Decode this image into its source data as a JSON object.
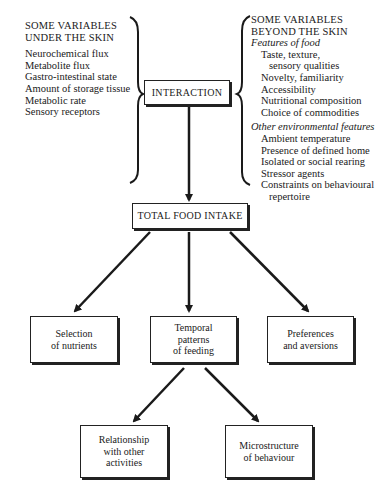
{
  "left_column": {
    "heading": [
      "SOME VARIABLES",
      "UNDER THE SKIN"
    ],
    "items": [
      "Neurochemical flux",
      "Metabolite flux",
      "Gastro-intestinal state",
      "Amount of storage tissue",
      "Metabolic rate",
      "Sensory receptors"
    ]
  },
  "right_column": {
    "heading": [
      "SOME VARIABLES",
      "BEYOND THE SKIN"
    ],
    "groups": [
      {
        "title": "Features of food",
        "items": [
          [
            "Taste, texture,",
            "sensory qualities"
          ],
          [
            "Novelty, familiarity"
          ],
          [
            "Accessibility"
          ],
          [
            "Nutritional composition"
          ],
          [
            "Choice of commodities"
          ]
        ]
      },
      {
        "title": "Other environmental features",
        "items": [
          [
            "Ambient temperature"
          ],
          [
            "Presence of defined home"
          ],
          [
            "Isolated or social rearing"
          ],
          [
            "Stressor agents"
          ],
          [
            "Constraints on behavioural",
            "repertoire"
          ]
        ]
      }
    ]
  },
  "nodes": {
    "interaction": "INTERACTION",
    "total_food_intake": "TOTAL FOOD INTAKE",
    "selection": [
      "Selection",
      "of nutrients"
    ],
    "temporal": [
      "Temporal",
      "patterns",
      "of feeding"
    ],
    "preferences": [
      "Preferences",
      "and aversions"
    ],
    "relationship": [
      "Relationship",
      "with other",
      "activities"
    ],
    "microstructure": [
      "Microstructure",
      "of behaviour"
    ]
  },
  "edges": [
    {
      "from": "interaction",
      "to": "total_food_intake"
    },
    {
      "from": "total_food_intake",
      "to": "selection"
    },
    {
      "from": "total_food_intake",
      "to": "temporal"
    },
    {
      "from": "total_food_intake",
      "to": "preferences"
    },
    {
      "from": "temporal",
      "to": "relationship"
    },
    {
      "from": "temporal",
      "to": "microstructure"
    }
  ],
  "colors": {
    "ink": "#1a1a1a",
    "background": "#ffffff"
  }
}
